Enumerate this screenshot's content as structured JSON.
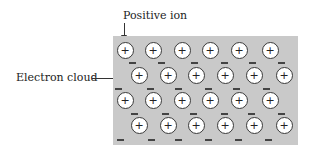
{
  "labels": {
    "positive_ion": "Positive ion",
    "electron_cloud": "Electron cloud"
  },
  "lattice": {
    "rows": [
      {
        "y": 50,
        "xs": [
          125,
          153,
          182,
          210,
          239,
          270
        ]
      },
      {
        "y": 75,
        "xs": [
          139,
          168,
          196,
          225,
          254,
          284
        ]
      },
      {
        "y": 100,
        "xs": [
          125,
          153,
          182,
          210,
          239,
          270
        ]
      },
      {
        "y": 125,
        "xs": [
          139,
          168,
          196,
          225,
          254,
          284
        ]
      }
    ],
    "ion_symbol": "+",
    "electrons": [
      {
        "x": 132,
        "y": 62
      },
      {
        "x": 161,
        "y": 62
      },
      {
        "x": 194,
        "y": 62
      },
      {
        "x": 224,
        "y": 62
      },
      {
        "x": 252,
        "y": 62
      },
      {
        "x": 281,
        "y": 62
      },
      {
        "x": 118,
        "y": 88
      },
      {
        "x": 150,
        "y": 88
      },
      {
        "x": 178,
        "y": 88
      },
      {
        "x": 208,
        "y": 88
      },
      {
        "x": 236,
        "y": 88
      },
      {
        "x": 266,
        "y": 88
      },
      {
        "x": 134,
        "y": 113
      },
      {
        "x": 165,
        "y": 113
      },
      {
        "x": 193,
        "y": 113
      },
      {
        "x": 224,
        "y": 113
      },
      {
        "x": 251,
        "y": 113
      },
      {
        "x": 281,
        "y": 113
      },
      {
        "x": 120,
        "y": 139
      },
      {
        "x": 151,
        "y": 139
      },
      {
        "x": 178,
        "y": 139
      },
      {
        "x": 208,
        "y": 139
      },
      {
        "x": 238,
        "y": 139
      },
      {
        "x": 268,
        "y": 139
      }
    ]
  },
  "colors": {
    "lattice_bg": "#c9c9c9",
    "ion_fill": "#ffffff",
    "stroke": "#3a3a3a"
  }
}
